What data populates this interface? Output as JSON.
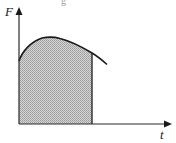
{
  "diagram": {
    "title_fragment": "g",
    "y_axis": {
      "label": "F"
    },
    "x_axis": {
      "label": "t"
    },
    "curve": {
      "description": "Force vs time curve rising from the F-axis to a maximum then decreasing",
      "points": [
        [
          19,
          61
        ],
        [
          24,
          50
        ],
        [
          32,
          43
        ],
        [
          42,
          38
        ],
        [
          50,
          37
        ],
        [
          62,
          39
        ],
        [
          75,
          44
        ],
        [
          88,
          51
        ],
        [
          92,
          53
        ],
        [
          100,
          59
        ],
        [
          107,
          65
        ]
      ]
    },
    "shaded_region": {
      "description": "Hatched area under the curve from t=0 to a cutoff time (impulse)",
      "x_start": 19,
      "x_end": 92,
      "fill_color": "#b8b8b8"
    },
    "colors": {
      "axis": "#2a2a2a",
      "curve": "#1a1a1a",
      "hatch_dark": "#8a8a8a",
      "hatch_light": "#e0e0e0"
    }
  }
}
